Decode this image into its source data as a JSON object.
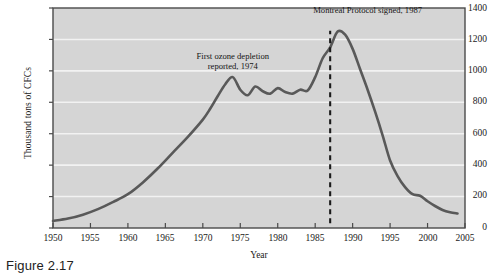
{
  "figure": {
    "caption": "Figure 2.17"
  },
  "chart_data": {
    "type": "line",
    "title": "",
    "xlabel": "Year",
    "ylabel": "Thousand tons of CFCs",
    "xlim": [
      1950,
      2005
    ],
    "ylim": [
      0,
      1400
    ],
    "grid": true,
    "legend_position": "none",
    "xticks": [
      1950,
      1955,
      1960,
      1965,
      1970,
      1975,
      1980,
      1985,
      1990,
      1995,
      2000,
      2005
    ],
    "yticks": [
      0,
      200,
      400,
      600,
      800,
      1000,
      1200,
      1400
    ],
    "series": [
      {
        "name": "CFC production",
        "color": "#595959",
        "x": [
          1950,
          1952,
          1954,
          1956,
          1958,
          1960,
          1962,
          1964,
          1966,
          1968,
          1970,
          1971,
          1972,
          1973,
          1974,
          1975,
          1976,
          1977,
          1978,
          1979,
          1980,
          1981,
          1982,
          1983,
          1984,
          1985,
          1986,
          1987,
          1988,
          1989,
          1990,
          1991,
          1992,
          1993,
          1994,
          1995,
          1996,
          1997,
          1998,
          1999,
          2000,
          2001,
          2002,
          2003,
          2004
        ],
        "y": [
          45,
          60,
          85,
          120,
          165,
          215,
          290,
          380,
          480,
          580,
          690,
          760,
          840,
          915,
          960,
          880,
          845,
          900,
          870,
          855,
          890,
          865,
          855,
          880,
          875,
          960,
          1080,
          1150,
          1250,
          1230,
          1140,
          1010,
          880,
          740,
          590,
          430,
          330,
          260,
          215,
          205,
          170,
          140,
          115,
          100,
          92
        ]
      }
    ],
    "annotations": [
      {
        "text_lines": [
          "First ozone depletion",
          "reported, 1974"
        ],
        "x": 1974,
        "y": 1075,
        "kind": "text-label"
      },
      {
        "text_lines": [
          "Montreal Protocol signed, 1987"
        ],
        "x": 1992,
        "y": 1370,
        "kind": "text-label"
      },
      {
        "text_lines": [],
        "x": 1987,
        "kind": "vertical-dashed-marker",
        "year": 1987
      }
    ],
    "style": {
      "plot_background": "#d5d5d5",
      "gridline_color": "#f2f2f2",
      "axis_color": "#4a4a4a",
      "line_color": "#595959"
    }
  }
}
